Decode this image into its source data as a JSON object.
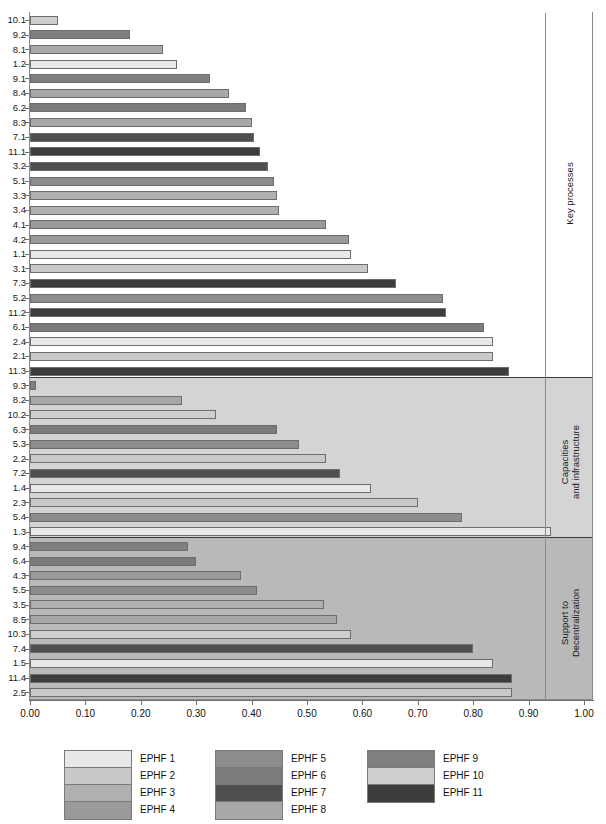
{
  "chart_data": {
    "type": "bar",
    "orientation": "horizontal",
    "title": "",
    "xlabel": "",
    "ylabel": "",
    "xlim": [
      0.0,
      1.0
    ],
    "grid": false,
    "legend_position": "bottom",
    "xticks": [
      "0.00",
      "0.10",
      "0.20",
      "0.30",
      "0.40",
      "0.50",
      "0.60",
      "0.70",
      "0.80",
      "0.90",
      "1.00"
    ],
    "xtick_values": [
      0.0,
      0.1,
      0.2,
      0.3,
      0.4,
      0.5,
      0.6,
      0.7,
      0.8,
      0.9,
      1.0
    ],
    "legend": [
      {
        "label": "EPHF 1",
        "color": "#e8e8e8"
      },
      {
        "label": "EPHF 2",
        "color": "#c9c9c9"
      },
      {
        "label": "EPHF 3",
        "color": "#b0b0b0"
      },
      {
        "label": "EPHF 4",
        "color": "#9a9a9a"
      },
      {
        "label": "EPHF 5",
        "color": "#8c8c8c"
      },
      {
        "label": "EPHF 6",
        "color": "#7b7b7b"
      },
      {
        "label": "EPHF 7",
        "color": "#4f4f4f"
      },
      {
        "label": "EPHF 8",
        "color": "#a8a8a8"
      },
      {
        "label": "EPHF 9",
        "color": "#7f7f7f"
      },
      {
        "label": "EPHF 10",
        "color": "#cfcfcf"
      },
      {
        "label": "EPHF 11",
        "color": "#3d3d3d"
      }
    ],
    "panels": [
      {
        "name": "Key processes",
        "background": "#ffffff",
        "categories": [
          "10.1",
          "9.2",
          "8.1",
          "1.2",
          "9.1",
          "8.4",
          "6.2",
          "8.3",
          "7.1",
          "11.1",
          "3.2",
          "5.1",
          "3.3",
          "3.4",
          "4.1",
          "4.2",
          "1.1",
          "3.1",
          "7.3",
          "5.2",
          "11.2",
          "6.1",
          "2.4",
          "2.1",
          "11.3"
        ],
        "values": [
          0.05,
          0.18,
          0.24,
          0.265,
          0.325,
          0.36,
          0.39,
          0.4,
          0.405,
          0.415,
          0.43,
          0.44,
          0.445,
          0.45,
          0.535,
          0.575,
          0.58,
          0.61,
          0.66,
          0.745,
          0.75,
          0.82,
          0.835,
          0.835,
          0.865
        ],
        "series": [
          "EPHF 10",
          "EPHF 9",
          "EPHF 8",
          "EPHF 1",
          "EPHF 9",
          "EPHF 8",
          "EPHF 6",
          "EPHF 8",
          "EPHF 7",
          "EPHF 11",
          "EPHF 7",
          "EPHF 5",
          "EPHF 3",
          "EPHF 3",
          "EPHF 4",
          "EPHF 4",
          "EPHF 1",
          "EPHF 2",
          "EPHF 11",
          "EPHF 5",
          "EPHF 11",
          "EPHF 6",
          "EPHF 1",
          "EPHF 2",
          "EPHF 11"
        ]
      },
      {
        "name": "Capacities and infrastructure",
        "background": "#d4d4d4",
        "categories": [
          "9.3",
          "8.2",
          "10.2",
          "6.3",
          "5.3",
          "2.2",
          "7.2",
          "1.4",
          "2.3",
          "5.4",
          "1.3"
        ],
        "values": [
          0.01,
          0.275,
          0.335,
          0.445,
          0.485,
          0.535,
          0.56,
          0.615,
          0.7,
          0.78,
          0.94
        ],
        "series": [
          "EPHF 9",
          "EPHF 8",
          "EPHF 10",
          "EPHF 6",
          "EPHF 5",
          "EPHF 2",
          "EPHF 7",
          "EPHF 1",
          "EPHF 2",
          "EPHF 5",
          "EPHF 1"
        ]
      },
      {
        "name": "Support to Decentralization",
        "background": "#b9b9b9",
        "categories": [
          "9.4",
          "6.4",
          "4.3",
          "5.5",
          "3.5",
          "8.5",
          "10.3",
          "7.4",
          "1.5",
          "11.4",
          "2.5"
        ],
        "values": [
          0.285,
          0.3,
          0.38,
          0.41,
          0.53,
          0.555,
          0.58,
          0.8,
          0.835,
          0.87,
          0.87
        ],
        "series": [
          "EPHF 9",
          "EPHF 6",
          "EPHF 4",
          "EPHF 5",
          "EPHF 3",
          "EPHF 8",
          "EPHF 10",
          "EPHF 7",
          "EPHF 1",
          "EPHF 11",
          "EPHF 2"
        ]
      }
    ]
  }
}
